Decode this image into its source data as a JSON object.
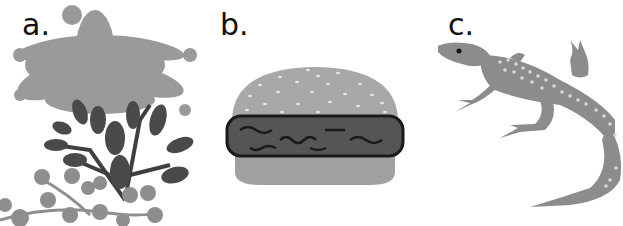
{
  "panels": [
    {
      "id": "a",
      "label": "a.",
      "subject": "plants"
    },
    {
      "id": "b",
      "label": "b.",
      "subject": "hamburger"
    },
    {
      "id": "c",
      "label": "c.",
      "subject": "lizard"
    }
  ],
  "colors": {
    "background": "#ffffff",
    "label_text": "#111111",
    "light_plant": "#9a9a9a",
    "dark_leaf": "#4a4a4a",
    "bun": "#a6a6a6",
    "sesame": "#e6e6e6",
    "patty": "#555555",
    "patty_outline": "#1a1a1a",
    "lizard_body": "#8c8c8c",
    "lizard_spots": "#d8d8d8"
  }
}
